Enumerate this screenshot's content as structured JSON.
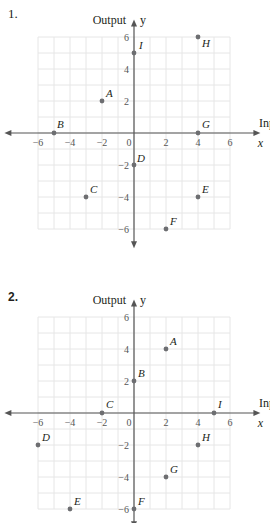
{
  "problems": [
    {
      "number": "1.",
      "y_axis_title": "Output",
      "x_axis_title": "Input",
      "x_var": "x",
      "y_var": "y"
    },
    {
      "number": "2.",
      "y_axis_title": "Output",
      "x_axis_title": "Input",
      "x_var": "x",
      "y_var": "y"
    }
  ],
  "chart_data": [
    {
      "type": "scatter",
      "title": "1.",
      "xlabel": "Input (x)",
      "ylabel": "Output (y)",
      "xlim": [
        -6,
        6
      ],
      "ylim": [
        -6,
        6
      ],
      "grid": true,
      "x_ticks": [
        -6,
        -4,
        -2,
        0,
        2,
        4,
        6
      ],
      "y_ticks": [
        -6,
        -4,
        -2,
        2,
        4,
        6
      ],
      "points": [
        {
          "label": "A",
          "x": -2,
          "y": 2
        },
        {
          "label": "B",
          "x": -5,
          "y": 0
        },
        {
          "label": "C",
          "x": -3,
          "y": -4
        },
        {
          "label": "D",
          "x": 0,
          "y": -2
        },
        {
          "label": "E",
          "x": 4,
          "y": -4
        },
        {
          "label": "F",
          "x": 2,
          "y": -6
        },
        {
          "label": "G",
          "x": 4,
          "y": 0
        },
        {
          "label": "H",
          "x": 4,
          "y": 6
        },
        {
          "label": "I",
          "x": 0,
          "y": 5
        }
      ]
    },
    {
      "type": "scatter",
      "title": "2.",
      "xlabel": "Input (x)",
      "ylabel": "Output (y)",
      "xlim": [
        -6,
        6
      ],
      "ylim": [
        -6,
        6
      ],
      "grid": true,
      "x_ticks": [
        -6,
        -4,
        -2,
        0,
        2,
        4,
        6
      ],
      "y_ticks": [
        -6,
        -4,
        -2,
        2,
        4,
        6
      ],
      "points": [
        {
          "label": "A",
          "x": 2,
          "y": 4
        },
        {
          "label": "B",
          "x": 0,
          "y": 2
        },
        {
          "label": "C",
          "x": -2,
          "y": 0
        },
        {
          "label": "D",
          "x": -6,
          "y": -2
        },
        {
          "label": "E",
          "x": -4,
          "y": -6
        },
        {
          "label": "F",
          "x": 0,
          "y": -6
        },
        {
          "label": "G",
          "x": 2,
          "y": -4
        },
        {
          "label": "H",
          "x": 4,
          "y": -2
        },
        {
          "label": "I",
          "x": 5,
          "y": 0
        }
      ]
    }
  ]
}
